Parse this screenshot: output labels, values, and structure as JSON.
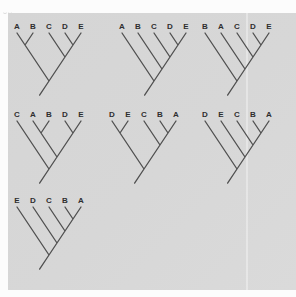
{
  "figure": {
    "colors": {
      "page_bg": "#fcfcfc",
      "panel_bg": "#d6d6d6",
      "branch": "#4f4f4f",
      "label": "#2e2e2e"
    },
    "geometry": {
      "leaf_spacing": 16,
      "branch_slope": 1.5,
      "root_stub_length": 17
    },
    "trees": [
      {
        "labels": [
          "A",
          "B",
          "C",
          "D",
          "E"
        ],
        "topology": "((A,B),(C,(D,E)))",
        "structure": [
          [
            0,
            1
          ],
          [
            2,
            [
              3,
              4
            ]
          ]
        ],
        "x": 9,
        "y": 22
      },
      {
        "labels": [
          "A",
          "B",
          "C",
          "D",
          "E"
        ],
        "topology": "(A,(B,(C,(D,E))))",
        "structure": [
          0,
          [
            1,
            [
              2,
              [
                3,
                4
              ]
            ]
          ]
        ],
        "x": 114,
        "y": 22
      },
      {
        "labels": [
          "B",
          "A",
          "C",
          "D",
          "E"
        ],
        "topology": "(B,(A,(C,(D,E))))",
        "structure": [
          0,
          [
            1,
            [
              2,
              [
                3,
                4
              ]
            ]
          ]
        ],
        "x": 197,
        "y": 22
      },
      {
        "labels": [
          "C",
          "A",
          "B",
          "D",
          "E"
        ],
        "topology": "(C,((A,B),(D,E)))",
        "structure": [
          0,
          [
            [
              1,
              2
            ],
            [
              3,
              4
            ]
          ]
        ],
        "x": 9,
        "y": 110
      },
      {
        "labels": [
          "D",
          "E",
          "C",
          "B",
          "A"
        ],
        "topology": "((D,E),(C,(B,A)))",
        "structure": [
          [
            0,
            1
          ],
          [
            2,
            [
              3,
              4
            ]
          ]
        ],
        "x": 104,
        "y": 110
      },
      {
        "labels": [
          "D",
          "E",
          "C",
          "B",
          "A"
        ],
        "topology": "(D,(E,(C,(B,A))))",
        "structure": [
          0,
          [
            1,
            [
              2,
              [
                3,
                4
              ]
            ]
          ]
        ],
        "x": 197,
        "y": 110
      },
      {
        "labels": [
          "E",
          "D",
          "C",
          "B",
          "A"
        ],
        "topology": "(E,(D,(C,(B,A))))",
        "structure": [
          0,
          [
            1,
            [
              2,
              [
                3,
                4
              ]
            ]
          ]
        ],
        "x": 9,
        "y": 196
      }
    ]
  }
}
